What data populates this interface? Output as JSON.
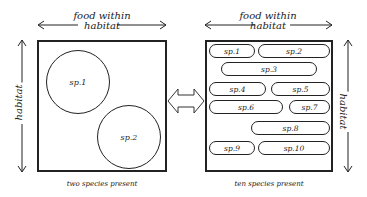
{
  "left_panel": {
    "top_label_line1": "food within",
    "top_label_line2": "habitat",
    "side_label": "habitat",
    "caption": "two species present",
    "species": [
      {
        "label": "sp.1"
      },
      {
        "label": "sp.2"
      }
    ]
  },
  "right_panel": {
    "top_label_line1": "food within",
    "top_label_line2": "habitat",
    "side_label": "habitat",
    "caption": "ten species present",
    "species": [
      {
        "label": "sp.1"
      },
      {
        "label": "sp.2"
      },
      {
        "label": "sp.3"
      },
      {
        "label": "sp.4"
      },
      {
        "label": "sp.5"
      },
      {
        "label": "sp.6"
      },
      {
        "label": "sp.7"
      },
      {
        "label": "sp.8"
      },
      {
        "label": "sp.9"
      },
      {
        "label": "sp.10"
      }
    ]
  },
  "connector": {
    "icon": "double-arrow-icon"
  }
}
